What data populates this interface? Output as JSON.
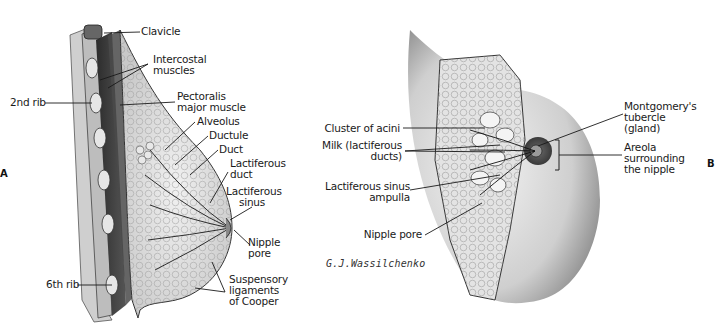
{
  "figure": {
    "panel_left": "A",
    "panel_right": "B",
    "signature": "G.J.Wassilchenko"
  },
  "left_diagram": {
    "labels": [
      {
        "id": "clavicle",
        "text": "Clavicle"
      },
      {
        "id": "intercostal",
        "text": "Intercostal\nmuscles"
      },
      {
        "id": "second-rib",
        "text": "2nd rib"
      },
      {
        "id": "pectoralis",
        "text": "Pectoralis\nmajor muscle"
      },
      {
        "id": "alveolus",
        "text": "Alveolus"
      },
      {
        "id": "ductule",
        "text": "Ductule"
      },
      {
        "id": "duct",
        "text": "Duct"
      },
      {
        "id": "lactiferous-duct",
        "text": "Lactiferous\nduct"
      },
      {
        "id": "lactiferous-sinus",
        "text": "Lactiferous\nsinus"
      },
      {
        "id": "nipple-pore",
        "text": "Nipple\npore"
      },
      {
        "id": "sixth-rib",
        "text": "6th rib"
      },
      {
        "id": "suspensory",
        "text": "Suspensory\nligaments\nof Cooper"
      }
    ]
  },
  "right_diagram": {
    "labels": [
      {
        "id": "acini",
        "text": "Cluster of acini"
      },
      {
        "id": "milk",
        "text": "Milk (lactiferous\nducts)"
      },
      {
        "id": "sinus-ampulla",
        "text": "Lactiferous sinus\nampulla"
      },
      {
        "id": "nipple-pore",
        "text": "Nipple pore"
      },
      {
        "id": "montgomery",
        "text": "Montgomery's\ntubercle\n(gland)"
      },
      {
        "id": "areola",
        "text": "Areola\nsurrounding\nthe nipple"
      }
    ]
  },
  "colors": {
    "line": "#1a1a1a",
    "tissue": "#d9d9d9",
    "muscle": "#3a3a3a",
    "skin": "#bdbdbd"
  }
}
